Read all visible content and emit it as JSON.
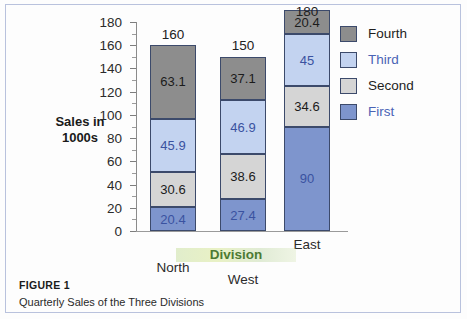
{
  "figure": {
    "caption_title": "FIGURE 1",
    "caption_text": "Quarterly Sales of the Three Divisions"
  },
  "chart_data": {
    "type": "bar",
    "subtype": "stacked-vertical",
    "title": "",
    "xlabel": "Division",
    "ylabel": "Sales in\n1000s",
    "ylabel_line1": "Sales in",
    "ylabel_line2": "1000s",
    "categories": [
      "North",
      "West",
      "East"
    ],
    "ylim": [
      0,
      180
    ],
    "ytick_major": [
      0,
      20,
      40,
      60,
      80,
      100,
      120,
      140,
      160,
      180
    ],
    "ytick_minor": [
      10,
      30,
      50,
      70,
      90,
      110,
      130,
      150,
      170
    ],
    "ytick_labels": [
      "0",
      "20",
      "40",
      "60",
      "80",
      "100",
      "120",
      "140",
      "160",
      "180"
    ],
    "grid": false,
    "legend_position": "right",
    "stack_order_bottom_to_top": [
      "First",
      "Second",
      "Third",
      "Fourth"
    ],
    "series": [
      {
        "name": "First",
        "color": "#7e95cd",
        "label_color": "#3a52a0",
        "values": [
          20.4,
          27.4,
          90
        ],
        "value_labels": [
          "20.4",
          "27.4",
          "90"
        ]
      },
      {
        "name": "Second",
        "color": "#d5d5d5",
        "label_color": "#1b1b1b",
        "values": [
          30.6,
          38.6,
          34.6
        ],
        "value_labels": [
          "30.6",
          "38.6",
          "34.6"
        ]
      },
      {
        "name": "Third",
        "color": "#c3d3f0",
        "label_color": "#3a52a0",
        "values": [
          45.9,
          46.9,
          45
        ],
        "value_labels": [
          "45.9",
          "46.9",
          "45"
        ]
      },
      {
        "name": "Fourth",
        "color": "#8d8d8d",
        "label_color": "#1b1b1b",
        "values": [
          63.1,
          37.1,
          20.4
        ],
        "value_labels": [
          "63.1",
          "37.1",
          "20.4"
        ]
      }
    ],
    "totals": [
      160,
      150,
      180
    ],
    "total_labels": [
      "160",
      "150",
      "180"
    ],
    "legend": [
      {
        "label": "Fourth",
        "swatch_color": "#8d8d8d",
        "text_color": "#1e1e1e"
      },
      {
        "label": "Third",
        "swatch_color": "#c3d3f0",
        "text_color": "#4a63b5"
      },
      {
        "label": "Second",
        "swatch_color": "#d5d5d5",
        "text_color": "#1e1e1e"
      },
      {
        "label": "First",
        "swatch_color": "#7e95cd",
        "text_color": "#4a63b5"
      }
    ],
    "xlabel_color": "#4d7a33"
  }
}
